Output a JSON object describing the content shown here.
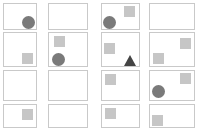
{
  "grid": {
    "rows": 4,
    "columns": 4,
    "cards": [
      {
        "id": "r1c1",
        "shapes": [
          "circle"
        ]
      },
      {
        "id": "r1c2",
        "shapes": []
      },
      {
        "id": "r1c3",
        "shapes": [
          "circle",
          "square"
        ]
      },
      {
        "id": "r1c4",
        "shapes": []
      },
      {
        "id": "r2c1",
        "shapes": [
          "square"
        ]
      },
      {
        "id": "r2c2",
        "shapes": [
          "square",
          "circle"
        ]
      },
      {
        "id": "r2c3",
        "shapes": [
          "square",
          "triangle"
        ]
      },
      {
        "id": "r2c4",
        "shapes": [
          "square",
          "square"
        ]
      },
      {
        "id": "r3c1",
        "shapes": []
      },
      {
        "id": "r3c2",
        "shapes": []
      },
      {
        "id": "r3c3",
        "shapes": [
          "square"
        ]
      },
      {
        "id": "r3c4",
        "shapes": [
          "square",
          "circle"
        ]
      },
      {
        "id": "r4c1",
        "shapes": [
          "square"
        ]
      },
      {
        "id": "r4c2",
        "shapes": []
      },
      {
        "id": "r4c3",
        "shapes": [
          "square"
        ]
      },
      {
        "id": "r4c4",
        "shapes": [
          "square"
        ]
      }
    ]
  },
  "colors": {
    "circle": "#7a7a7a",
    "square": "#c6c6c6",
    "triangle": "#444444",
    "card_border": "#c9c9c9"
  }
}
